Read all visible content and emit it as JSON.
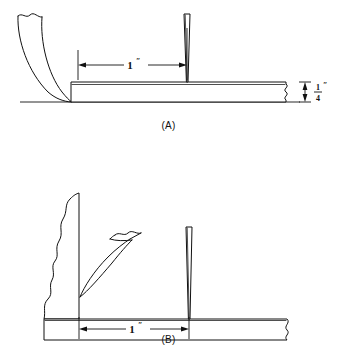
{
  "sheet": {
    "title": "Chisel and knife bevel angle illustration",
    "background_color": "#ffffff",
    "line_color": "#111111"
  },
  "figures": [
    {
      "id": "figure-a",
      "caption": "(A)",
      "description": "Curved gouge blade set against the edge of a 1/4 inch thick board with a thin straight knife blade standing vertically 1 inch away",
      "dimensions": [
        {
          "name": "horizontal-span",
          "label": "1",
          "unit_mark": "″",
          "orientation": "horizontal",
          "from": "board-left-edge",
          "to": "knife-blade"
        },
        {
          "name": "board-thickness",
          "label_numerator": "1",
          "label_denominator": "4",
          "unit_mark": "″",
          "orientation": "vertical",
          "from": "board-top",
          "to": "board-bottom"
        }
      ],
      "parts": [
        {
          "name": "curved-gouge-blade",
          "style": "outline"
        },
        {
          "name": "board",
          "style": "outline",
          "break_edge": "zigzag-right"
        },
        {
          "name": "thin-knife-blade",
          "style": "outline"
        },
        {
          "name": "baseline",
          "style": "line"
        }
      ]
    },
    {
      "id": "figure-b",
      "caption": "(B)",
      "description": "Curved gouge blade leaning against a broken vertical wall standing on a board, with a thin straight knife blade 1 inch away",
      "dimensions": [
        {
          "name": "horizontal-span",
          "label": "1",
          "unit_mark": "″",
          "orientation": "horizontal",
          "from": "wall-face",
          "to": "knife-blade"
        }
      ],
      "parts": [
        {
          "name": "broken-vertical-wall",
          "style": "outline",
          "break_edge": "jagged-left"
        },
        {
          "name": "curved-gouge-blade",
          "style": "outline",
          "break_edge": "wavy-top"
        },
        {
          "name": "board",
          "style": "outline",
          "break_edge": "wavy-right"
        },
        {
          "name": "thin-knife-blade",
          "style": "outline"
        }
      ]
    }
  ]
}
